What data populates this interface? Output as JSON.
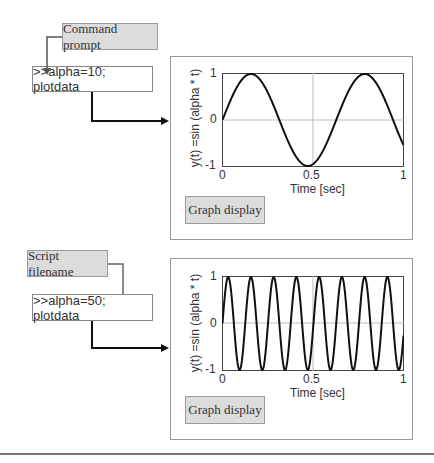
{
  "diagram": {
    "top": {
      "source_label": "Command prompt",
      "command": ">>alpha=10; plotdata",
      "graph_button": "Graph display",
      "plot": {
        "ylabel": "y(t) =sin (alpha * t)",
        "xlabel": "Time [sec]",
        "yticks": [
          "1",
          "0",
          "-1"
        ],
        "xticks": [
          "0",
          "0.5",
          "1"
        ]
      }
    },
    "bottom": {
      "source_label": "Script filename",
      "command": ">>alpha=50; plotdata",
      "graph_button": "Graph display",
      "plot": {
        "ylabel": "y(t) =sin (alpha * t)",
        "xlabel": "Time [sec]",
        "yticks": [
          "1",
          "0",
          "-1"
        ],
        "xticks": [
          "0",
          "0.5",
          "1"
        ]
      }
    }
  },
  "chart_data": [
    {
      "type": "line",
      "title": "",
      "xlabel": "Time [sec]",
      "ylabel": "y(t) =sin (alpha * t)",
      "function": "sin(10*t)",
      "alpha": 10,
      "xlim": [
        0,
        1
      ],
      "ylim": [
        -1,
        1
      ],
      "grid": "center lines at x=0.5, y=0",
      "x": [
        0,
        0.1,
        0.157,
        0.2,
        0.3,
        0.4,
        0.471,
        0.5,
        0.6,
        0.7,
        0.785,
        0.8,
        0.9,
        1.0
      ],
      "y": [
        0,
        0.84,
        1,
        0.91,
        0.14,
        -0.76,
        -1,
        -0.96,
        -0.28,
        0.66,
        1,
        0.99,
        0.41,
        -0.54
      ]
    },
    {
      "type": "line",
      "title": "",
      "xlabel": "Time [sec]",
      "ylabel": "y(t) =sin (alpha * t)",
      "function": "sin(50*t)",
      "alpha": 50,
      "xlim": [
        0,
        1
      ],
      "ylim": [
        -1,
        1
      ],
      "grid": "center lines at x=0.5, y=0",
      "peaks_x": [
        0.031,
        0.157,
        0.283,
        0.408,
        0.534,
        0.66,
        0.785,
        0.911
      ],
      "troughs_x": [
        0.094,
        0.22,
        0.346,
        0.471,
        0.597,
        0.723,
        0.848,
        0.974
      ]
    }
  ]
}
